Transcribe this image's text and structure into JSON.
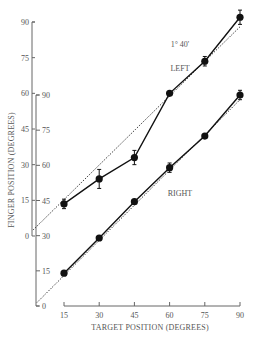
{
  "chart_data": {
    "type": "line",
    "title": "",
    "xlabel": "TARGET POSITION (DEGREES)",
    "ylabel": "FINGER POSITION (DEGREES)",
    "x": [
      15,
      30,
      45,
      60,
      75,
      90
    ],
    "x_ticks": [
      "15",
      "30",
      "45",
      "60",
      "75",
      "90"
    ],
    "xlim": [
      15,
      90
    ],
    "outer_y_ticks": [
      "0",
      "15",
      "30",
      "45",
      "60",
      "75",
      "90"
    ],
    "inner_y_ticks": [
      "0",
      "15",
      "30",
      "45",
      "60",
      "75",
      "90"
    ],
    "ylim": [
      0,
      90
    ],
    "grid": false,
    "annotations": [
      "1° 40'",
      "LEFT",
      "RIGHT"
    ],
    "series": [
      {
        "name": "LEFT",
        "axis": "outer",
        "values": [
          13.5,
          24,
          33,
          60,
          73.5,
          92
        ],
        "error": [
          2,
          4,
          3,
          0,
          2,
          3
        ]
      },
      {
        "name": "RIGHT",
        "axis": "inner",
        "values": [
          14,
          29,
          44.5,
          59,
          72.5,
          90
        ],
        "error": [
          0,
          0,
          0,
          2,
          0,
          2
        ]
      },
      {
        "name": "LEFT ideal (dotted)",
        "axis": "outer",
        "values": [
          15,
          30,
          45,
          60,
          75,
          90
        ]
      },
      {
        "name": "RIGHT ideal (dotted)",
        "axis": "inner",
        "values": [
          15,
          30,
          45,
          60,
          75,
          90
        ]
      }
    ]
  },
  "labels": {
    "xlabel": "TARGET POSITION (DEGREES)",
    "ylabel": "FINGER POSITION (DEGREES)",
    "annot_angle": "1° 40'",
    "annot_left": "LEFT",
    "annot_right": "RIGHT",
    "x_ticks": [
      "15",
      "30",
      "45",
      "60",
      "75",
      "90"
    ],
    "outer_ticks": [
      "0",
      "15",
      "30",
      "45",
      "60",
      "75",
      "90"
    ],
    "inner_ticks": [
      "0",
      "15",
      "30",
      "45",
      "60",
      "75",
      "90"
    ]
  }
}
